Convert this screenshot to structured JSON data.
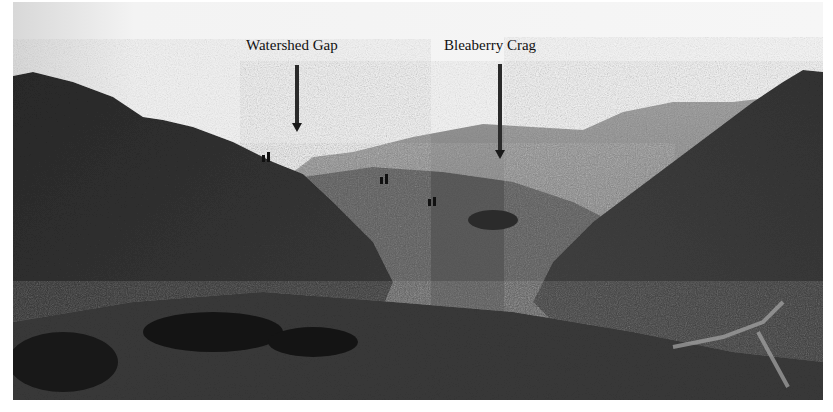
{
  "figure": {
    "type": "black-and-white landscape photograph",
    "annotations": [
      {
        "label": "Watershed Gap",
        "arrow": "down"
      },
      {
        "label": "Bleaberry Crag",
        "arrow": "down"
      }
    ]
  },
  "colors": {
    "sky": "#f0f0f0",
    "far_ridge": "#7a7a7a",
    "mid_hill": "#4a4a4a",
    "near_hill": "#2e2e2e",
    "shadow": "#151515",
    "label_text": "#111111"
  }
}
